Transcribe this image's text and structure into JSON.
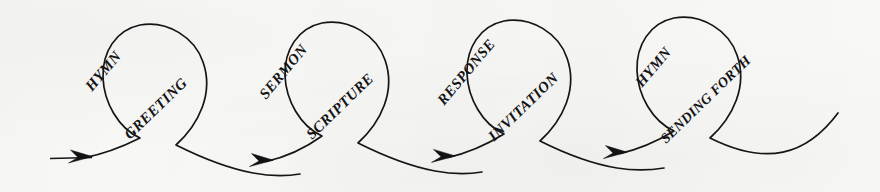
{
  "diagram": {
    "background_color": "#f8f8f7",
    "ink_color": "#151515",
    "loop_count": 4,
    "arrow_count": 4,
    "entry_arrow_label": "",
    "loops": [
      {
        "index": 1,
        "upper_label": "HYMN",
        "lower_label": "GREETING",
        "crossing": {
          "x": 118,
          "y": 140
        }
      },
      {
        "index": 2,
        "upper_label": "SERMON",
        "lower_label": "SCRIPTURE",
        "crossing": {
          "x": 300,
          "y": 138
        }
      },
      {
        "index": 3,
        "upper_label": "RESPONSE",
        "lower_label": "INVITATION",
        "crossing": {
          "x": 482,
          "y": 136
        }
      },
      {
        "index": 4,
        "upper_label": "HYMN",
        "lower_label": "SENDING FORTH",
        "crossing": {
          "x": 664,
          "y": 134
        }
      }
    ],
    "sequence": [
      "HYMN",
      "GREETING",
      "SERMON",
      "SCRIPTURE",
      "RESPONSE",
      "INVITATION",
      "HYMN",
      "SENDING FORTH"
    ],
    "arrows": [
      {
        "index": 1,
        "tip_x": 85,
        "tip_y": 157
      },
      {
        "index": 2,
        "tip_x": 266,
        "tip_y": 161
      },
      {
        "index": 3,
        "tip_x": 448,
        "tip_y": 157
      },
      {
        "index": 4,
        "tip_x": 620,
        "tip_y": 153
      }
    ]
  }
}
